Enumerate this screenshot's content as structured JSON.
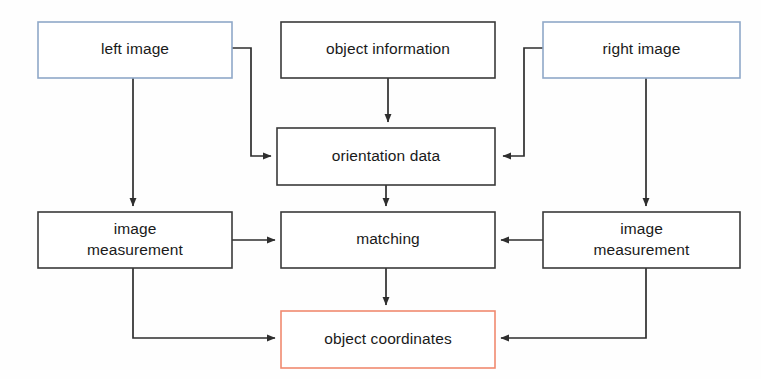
{
  "diagram": {
    "canvas": {
      "width": 761,
      "height": 379,
      "background": "#fefefe"
    },
    "colors": {
      "border_blue": "#8fa8c8",
      "border_dark": "#3a3a3a",
      "border_salmon": "#f08a70",
      "box_fill": "#ffffff",
      "edge": "#2e2e2e",
      "text": "#1a1a1a"
    },
    "nodes": [
      {
        "id": "left-image",
        "label": "left image",
        "lines": [
          "left image"
        ],
        "border_color": "#8fa8c8",
        "x": 38,
        "y": 22,
        "w": 194,
        "h": 56
      },
      {
        "id": "object-information",
        "label": "object information",
        "lines": [
          "object information"
        ],
        "border_color": "#3a3a3a",
        "x": 281,
        "y": 22,
        "w": 214,
        "h": 56
      },
      {
        "id": "right-image",
        "label": "right image",
        "lines": [
          "right image"
        ],
        "border_color": "#8fa8c8",
        "x": 543,
        "y": 22,
        "w": 197,
        "h": 56
      },
      {
        "id": "orientation-data",
        "label": "orientation data",
        "lines": [
          "orientation data"
        ],
        "border_color": "#3a3a3a",
        "x": 277,
        "y": 128,
        "w": 218,
        "h": 57
      },
      {
        "id": "image-measurement-left",
        "label": "image measurement",
        "lines": [
          "image",
          "measurement"
        ],
        "border_color": "#3a3a3a",
        "x": 38,
        "y": 212,
        "w": 194,
        "h": 56
      },
      {
        "id": "matching",
        "label": "matching",
        "lines": [
          "matching"
        ],
        "border_color": "#3a3a3a",
        "x": 281,
        "y": 212,
        "w": 214,
        "h": 56
      },
      {
        "id": "image-measurement-right",
        "label": "image measurement",
        "lines": [
          "image",
          "measurement"
        ],
        "border_color": "#3a3a3a",
        "x": 543,
        "y": 212,
        "w": 197,
        "h": 56
      },
      {
        "id": "object-coordinates",
        "label": "object coordinates",
        "lines": [
          "object coordinates"
        ],
        "border_color": "#f08a70",
        "x": 281,
        "y": 311,
        "w": 214,
        "h": 57
      }
    ],
    "edges": [
      {
        "id": "left-image-to-orientation-data",
        "from": "left-image",
        "to": "orientation-data",
        "path": "M 232 48 L 251 48 L 251 156 L 271 156",
        "arrow": true
      },
      {
        "id": "left-image-to-image-measurement-left",
        "from": "left-image",
        "to": "image-measurement-left",
        "path": "M 133 78 L 133 206",
        "arrow": true
      },
      {
        "id": "object-information-to-orientation-data",
        "from": "object-information",
        "to": "orientation-data",
        "path": "M 388 78 L 388 122",
        "arrow": true
      },
      {
        "id": "right-image-to-orientation-data",
        "from": "right-image",
        "to": "orientation-data",
        "path": "M 543 48 L 524 48 L 524 156 L 503 156",
        "arrow": true
      },
      {
        "id": "right-image-to-image-measurement-right",
        "from": "right-image",
        "to": "image-measurement-right",
        "path": "M 646 78 L 646 206",
        "arrow": true
      },
      {
        "id": "orientation-data-to-matching",
        "from": "orientation-data",
        "to": "matching",
        "path": "M 386 185 L 386 206",
        "arrow": true
      },
      {
        "id": "image-measurement-left-to-matching",
        "from": "image-measurement-left",
        "to": "matching",
        "path": "M 232 240 L 275 240",
        "arrow": true
      },
      {
        "id": "image-measurement-right-to-matching",
        "from": "image-measurement-right",
        "to": "matching",
        "path": "M 543 240 L 501 240",
        "arrow": true
      },
      {
        "id": "matching-to-object-coordinates",
        "from": "matching",
        "to": "object-coordinates",
        "path": "M 386 268 L 386 305",
        "arrow": true
      },
      {
        "id": "image-measurement-left-to-object-coordinates",
        "from": "image-measurement-left",
        "to": "object-coordinates",
        "path": "M 133 268 L 133 338 L 275 338",
        "arrow": true
      },
      {
        "id": "image-measurement-right-to-object-coordinates",
        "from": "image-measurement-right",
        "to": "object-coordinates",
        "path": "M 646 268 L 646 338 L 501 338",
        "arrow": true
      }
    ]
  }
}
